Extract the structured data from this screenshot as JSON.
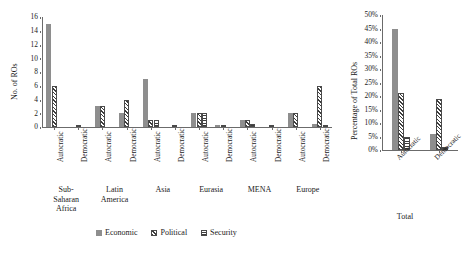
{
  "chart_data": [
    {
      "type": "bar",
      "id": "left-panel",
      "title": "",
      "xlabel": "",
      "ylabel": "No. of ROs",
      "ylim": [
        0,
        16
      ],
      "yticks": [
        "0",
        "2",
        "4",
        "6",
        "8",
        "10",
        "12",
        "14",
        "16"
      ],
      "grid": false,
      "legend_position": "bottom",
      "series_names": [
        "Economic",
        "Political",
        "Security"
      ],
      "groups": [
        {
          "region": "Sub-Saharan Africa",
          "region_lines": [
            "Sub-",
            "Saharan",
            "Africa"
          ],
          "regimes": [
            {
              "label": "Autocratic",
              "Economic": 15,
              "Political": 6,
              "Security": 0
            },
            {
              "label": "Democratic",
              "Economic": 0,
              "Political": 0.35,
              "Security": 0
            }
          ]
        },
        {
          "region": "Latin America",
          "region_lines": [
            "Latin",
            "America"
          ],
          "regimes": [
            {
              "label": "Autocratic",
              "Economic": 3,
              "Political": 3,
              "Security": 0
            },
            {
              "label": "Democratic",
              "Economic": 2,
              "Political": 4,
              "Security": 0
            }
          ]
        },
        {
          "region": "Asia",
          "region_lines": [
            "Asia"
          ],
          "regimes": [
            {
              "label": "Autocratic",
              "Economic": 7,
              "Political": 1,
              "Security": 1
            },
            {
              "label": "Democratic",
              "Economic": 0,
              "Political": 0.35,
              "Security": 0
            }
          ]
        },
        {
          "region": "Eurasia",
          "region_lines": [
            "Eurasia"
          ],
          "regimes": [
            {
              "label": "Autocratic",
              "Economic": 2,
              "Political": 2,
              "Security": 2
            },
            {
              "label": "Democratic",
              "Economic": 0.35,
              "Political": 0.35,
              "Security": 0
            }
          ]
        },
        {
          "region": "MENA",
          "region_lines": [
            "MENA"
          ],
          "regimes": [
            {
              "label": "Autocratic",
              "Economic": 1,
              "Political": 1,
              "Security": 0.5
            },
            {
              "label": "Democratic",
              "Economic": 0,
              "Political": 0.35,
              "Security": 0
            }
          ]
        },
        {
          "region": "Europe",
          "region_lines": [
            "Europe"
          ],
          "regimes": [
            {
              "label": "Autocratic",
              "Economic": 2,
              "Political": 2,
              "Security": 0
            },
            {
              "label": "Democratic",
              "Economic": 0.4,
              "Political": 6,
              "Security": 0.3
            }
          ]
        }
      ]
    },
    {
      "type": "bar",
      "id": "right-panel",
      "title": "",
      "xlabel": "Total",
      "ylabel": "Percentage of Total ROs",
      "ylim": [
        0,
        50
      ],
      "yticks": [
        "0%",
        "5%",
        "10%",
        "15%",
        "20%",
        "25%",
        "30%",
        "35%",
        "40%",
        "45%",
        "50%"
      ],
      "grid": false,
      "series_names": [
        "Economic",
        "Political",
        "Security"
      ],
      "categories": [
        "Autocratic",
        "Democratic"
      ],
      "series": [
        {
          "name": "Economic",
          "values": [
            45,
            6
          ]
        },
        {
          "name": "Political",
          "values": [
            21,
            19
          ]
        },
        {
          "name": "Security",
          "values": [
            5,
            1
          ]
        }
      ]
    }
  ],
  "legend": {
    "items": [
      {
        "label": "Economic",
        "pattern": "solid-gray"
      },
      {
        "label": "Political",
        "pattern": "diagonal-hatch"
      },
      {
        "label": "Security",
        "pattern": "horizontal-lines"
      }
    ]
  },
  "colors": {
    "economic": "#8e8e8e",
    "hatch": "#3d3d3d",
    "axis": "#6b6b6b",
    "text": "#1a1a1a",
    "background": "#ffffff"
  }
}
